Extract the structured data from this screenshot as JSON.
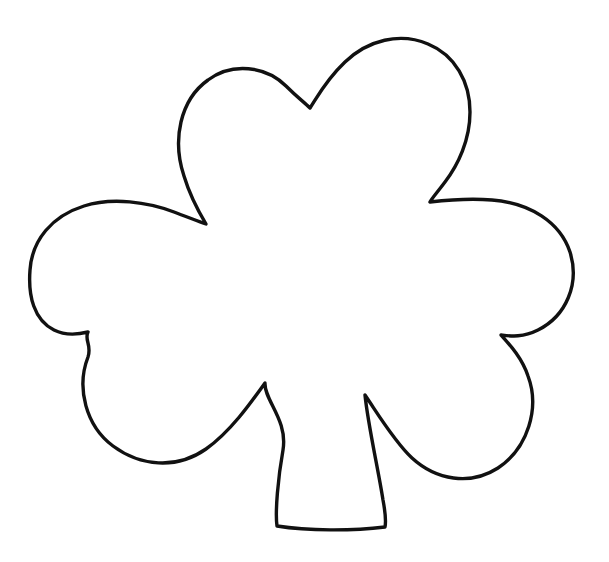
{
  "canvas": {
    "width": 609,
    "height": 562,
    "background_color": "#ffffff",
    "alt_text": "Shamrock outline coloring page"
  },
  "artwork": {
    "name": "shamrock-outline",
    "title": "Shamrock Outline",
    "stroke_color": "#111111",
    "fill_color": "#ffffff",
    "stroke_width": 3.4,
    "style": "line-art-coloring-page",
    "leaf_count": 3,
    "has_stem": true,
    "path_d": "M 310 108 C 318 96 326 80 345 62 C 368 40 400 32 428 44 C 455 55 470 82 470 112 C 470 140 458 165 445 182 C 436 194 432 198 430 202 C 447 200 470 198 492 200 C 530 203 560 222 570 252 C 580 284 566 316 538 330 C 522 338 510 336 501 335 C 510 345 522 358 528 376 C 540 408 528 448 498 468 C 470 486 436 480 412 458 C 394 441 378 414 365 395 C 368 425 378 468 383 500 C 386 516 386 522 385 527 C 352 531 308 531 277 526 C 275 512 278 478 283 450 C 288 420 264 400 265 383 C 250 404 230 432 206 449 C 176 470 140 466 113 446 C 86 426 76 388 88 357 C 92 345 84 340 88 332 C 80 334 66 336 54 330 C 34 320 28 296 30 270 C 32 240 52 216 84 206 C 112 197 148 202 174 212 C 190 218 200 222 206 224 C 200 214 190 196 184 176 C 172 140 180 100 208 80 C 232 62 266 66 286 86 C 298 98 304 102 310 108 Z"
  }
}
